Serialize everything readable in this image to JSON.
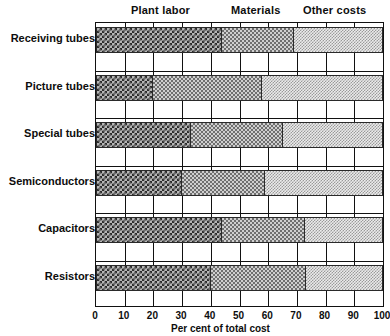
{
  "chart_data": {
    "type": "bar",
    "orientation": "horizontal",
    "stacked": true,
    "title": "",
    "xlabel": "Per cent of total cost",
    "ylabel": "",
    "xlim": [
      0,
      100
    ],
    "xticks": [
      0,
      10,
      20,
      30,
      40,
      50,
      60,
      70,
      80,
      90,
      100
    ],
    "grid": true,
    "legend_position": "top",
    "categories": [
      "Receiving tubes",
      "Picture tubes",
      "Special tubes",
      "Semiconductors",
      "Capacitors",
      "Resistors"
    ],
    "series": [
      {
        "name": "Plant labor",
        "values": [
          44,
          20,
          33,
          30,
          44,
          40
        ]
      },
      {
        "name": "Materials",
        "values": [
          25,
          38,
          32,
          29,
          29,
          33
        ]
      },
      {
        "name": "Other costs",
        "values": [
          31,
          42,
          35,
          41,
          27,
          27
        ]
      }
    ],
    "segment_headers": [
      "Plant labor",
      "Materials",
      "Other costs"
    ],
    "colors": {
      "plant_labor": "#2b2b2b",
      "materials": "#6f6f6f",
      "other_costs": "#9a9a9a",
      "axis": "#111111",
      "background": "#ffffff"
    }
  }
}
